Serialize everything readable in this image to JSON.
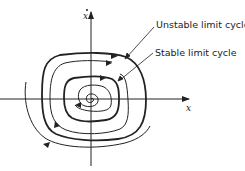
{
  "figure": {
    "type": "phase-portrait",
    "axes": {
      "horizontal_label": "x",
      "vertical_label": "x",
      "vertical_label_has_dot": true
    },
    "annotations": [
      {
        "id": "unstable",
        "text": "Unstable limit cycle"
      },
      {
        "id": "stable",
        "text": "Stable limit cycle"
      }
    ],
    "curves": [
      {
        "name": "unstable-limit-cycle",
        "style": "thick"
      },
      {
        "name": "stable-limit-cycle",
        "style": "thick"
      },
      {
        "name": "trajectory-between-cycles",
        "style": "thin"
      },
      {
        "name": "inner-spiral-trajectory",
        "style": "thin"
      },
      {
        "name": "outer-trajectory",
        "style": "thin"
      }
    ],
    "colors": {
      "ink": "#222222",
      "background": "#ffffff"
    }
  }
}
